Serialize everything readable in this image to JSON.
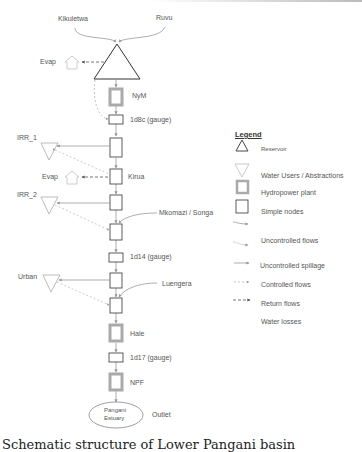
{
  "diagram": {
    "inflows": [
      "Kikuletwa",
      "Ruvu"
    ],
    "nodes": {
      "reservoir": "NyM reservoir",
      "nym": "NyM",
      "gauge_1d8c": "1d8c (gauge)",
      "irr1": "IRR_1",
      "evap_top": "Evap",
      "evap_mid": "Evap",
      "kirua": "Kirua",
      "irr2": "IRR_2",
      "mkomazi": "Mkomazi / Songa",
      "gauge_1d14": "1d14 (gauge)",
      "urban": "Urban",
      "luengera": "Luengera",
      "hale": "Hale",
      "gauge_1d17": "1d17 (gauge)",
      "npf": "NPF",
      "estuary_line1": "Pangani",
      "estuary_line2": "Estuary",
      "outlet": "Outlet"
    },
    "colors": {
      "line": "#999999",
      "node_border": "#333333",
      "hydro_border": "#aaaaaa"
    }
  },
  "legend": {
    "title": "Legend",
    "items": [
      {
        "label": "Reservoir",
        "icon": "reservoir-icon"
      },
      {
        "label": "Water Users / Abstractions",
        "icon": "water-user-icon"
      },
      {
        "label": "Hydropower plant",
        "icon": "hydropower-icon"
      },
      {
        "label": "Simple nodes",
        "icon": "simple-node-icon"
      },
      {
        "label": "Uncontrolled flows",
        "icon": "uncontrolled-flow-icon"
      },
      {
        "label": "Uncontrolled spillage",
        "icon": "spillage-icon"
      },
      {
        "label": "Controlled  flows",
        "icon": "controlled-flow-icon"
      },
      {
        "label": "Return flows",
        "icon": "return-flow-icon"
      },
      {
        "label": "Water losses",
        "icon": "water-loss-icon"
      }
    ]
  },
  "caption": "Schematic structure of Lower Pangani basin"
}
